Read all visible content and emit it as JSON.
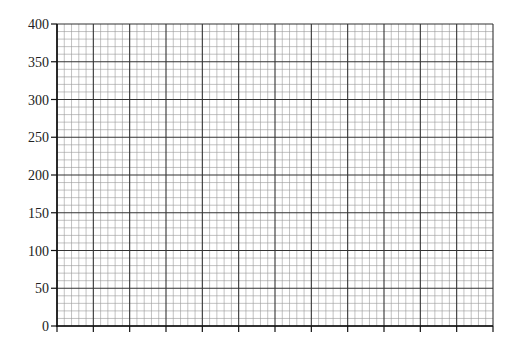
{
  "chart_data": {
    "type": "line",
    "title": "",
    "xlabel": "",
    "ylabel": "",
    "ylim": [
      0,
      400
    ],
    "yticks": [
      0,
      50,
      100,
      150,
      200,
      250,
      300,
      350,
      400
    ],
    "ytick_labels": [
      "0",
      "50",
      "100",
      "150",
      "200",
      "250",
      "300",
      "350",
      "400"
    ],
    "x_major_divisions": 12,
    "x_minor_per_major": 5,
    "y_minor_per_major": 5,
    "xtick_labels": [],
    "grid": true,
    "series": [],
    "legend": null
  },
  "colors": {
    "major_grid": "#333333",
    "minor_grid": "#999999",
    "axis": "#111111",
    "background": "#ffffff"
  }
}
